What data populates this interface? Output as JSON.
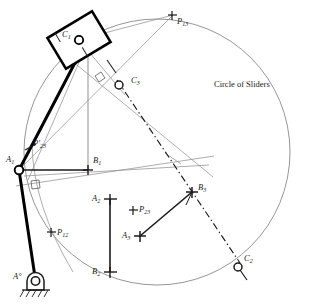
{
  "figure": {
    "background_color": "#ffffff",
    "width": 314,
    "height": 305,
    "colors": {
      "thin_line": "#8a8a8a",
      "medium_line": "#2b2b2b",
      "heavy_line": "#000000",
      "text": "#1a1a1a"
    },
    "annotations": {
      "circle_of_sliders": "Circle of Sliders"
    },
    "points": [
      {
        "id": "C1",
        "label": "C",
        "sub": "1",
        "x": 79,
        "y": 40,
        "label_x": 63,
        "label_y": 33,
        "marker": "open-circle"
      },
      {
        "id": "C3",
        "label": "C",
        "sub": "3",
        "x": 122,
        "y": 85,
        "label_x": 132,
        "label_y": 79,
        "marker": "open-circle"
      },
      {
        "id": "C2",
        "label": "C",
        "sub": "2",
        "x": 238,
        "y": 267,
        "label_x": 243,
        "label_y": 257,
        "marker": "open-circle"
      },
      {
        "id": "P13",
        "label": "P",
        "sub": "13",
        "x": 172,
        "y": 15,
        "label_x": 176,
        "label_y": 18,
        "marker": "cross"
      },
      {
        "id": "P23p",
        "label": "P",
        "sub": "23",
        "prime": true,
        "x": 30,
        "y": 146,
        "label_x": 33,
        "label_y": 142,
        "marker": "tick"
      },
      {
        "id": "P12",
        "label": "P",
        "sub": "12",
        "x": 51,
        "y": 232,
        "label_x": 56,
        "label_y": 231,
        "marker": "cross"
      },
      {
        "id": "P23",
        "label": "P",
        "sub": "23",
        "x": 133,
        "y": 210,
        "label_x": 138,
        "label_y": 206,
        "marker": "cross"
      },
      {
        "id": "A1",
        "label": "A",
        "sub": "1",
        "x": 19,
        "y": 170,
        "label_x": 8,
        "label_y": 158,
        "marker": "open-circle"
      },
      {
        "id": "A0",
        "label": "A",
        "sub": "",
        "degree": true,
        "x": 35,
        "y": 282,
        "label_x": 18,
        "label_y": 274,
        "marker": "ground-pivot"
      },
      {
        "id": "B1",
        "label": "B",
        "sub": "1",
        "x": 88,
        "y": 170,
        "label_x": 92,
        "label_y": 159,
        "marker": "cross"
      },
      {
        "id": "A2",
        "label": "A",
        "sub": "2",
        "x": 111,
        "y": 198,
        "label_x": 96,
        "label_y": 194,
        "marker": "cross"
      },
      {
        "id": "B2",
        "label": "B",
        "sub": "2",
        "x": 108,
        "y": 272,
        "label_x": 100,
        "label_y": 269,
        "marker": "cross"
      },
      {
        "id": "A3",
        "label": "A",
        "sub": "3",
        "x": 140,
        "y": 236,
        "label_x": 124,
        "label_y": 232,
        "marker": "cross"
      },
      {
        "id": "B3",
        "label": "B",
        "sub": "3",
        "x": 192,
        "y": 192,
        "label_x": 197,
        "label_y": 187,
        "marker": "cross"
      }
    ],
    "circle": {
      "name": "circle-of-sliders",
      "cx": 157,
      "cy": 152,
      "r": 133
    },
    "slider_block": {
      "name": "slider-block-c1",
      "cx": 79,
      "cy": 40,
      "w": 52,
      "h": 36,
      "rotation_deg": -31
    }
  }
}
